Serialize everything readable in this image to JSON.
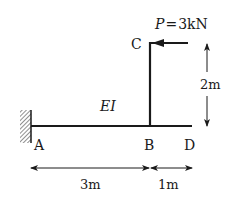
{
  "diagram": {
    "type": "structural-frame",
    "load": {
      "symbol": "P",
      "equals": "=",
      "value": "3kN",
      "direction": "left",
      "applied_at": "C"
    },
    "stiffness_label": "EI",
    "nodes": {
      "A": "A",
      "B": "B",
      "C": "C",
      "D": "D"
    },
    "support_A": "fixed",
    "dimensions": {
      "AB": "3m",
      "BD": "1m",
      "BC": "2m"
    },
    "colors": {
      "line": "#1a1a1a",
      "background": "#ffffff"
    }
  }
}
